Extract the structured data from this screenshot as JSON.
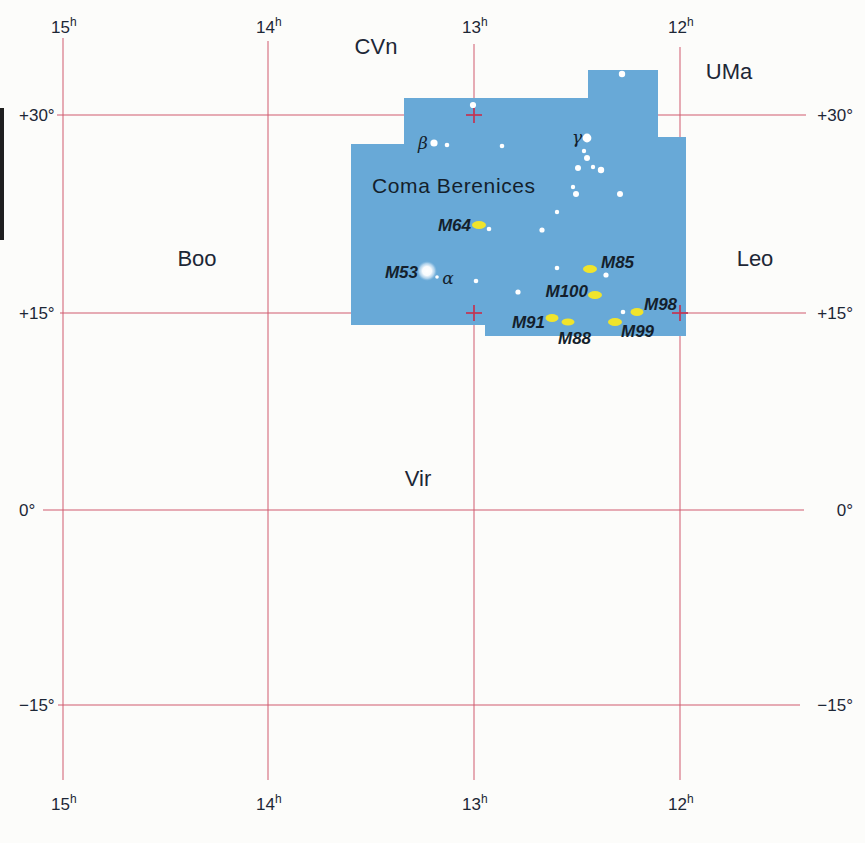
{
  "figure": {
    "width": 865,
    "height": 843,
    "background": "#fcfcfa",
    "colors": {
      "region_fill": "#68a9d7",
      "grid_line": "#d05a6e",
      "tick_cross": "#c23352",
      "text_dark": "#1d2736",
      "star_fill": "#ffffff",
      "messier_fill": "#f0e42c",
      "page_edge": "#1f1f1f"
    },
    "page_edge_bar": {
      "x": 0,
      "y": 108,
      "w": 4,
      "h": 132
    },
    "grid": {
      "top_label_baseline": 33,
      "bottom_label_baseline": 810,
      "left_label_x": 19,
      "right_label_x": 853,
      "vlines": [
        {
          "label": "15",
          "sup": "h",
          "x": 63,
          "y1": 38,
          "y2": 780
        },
        {
          "label": "14",
          "sup": "h",
          "x": 268,
          "y1": 41,
          "y2": 780
        },
        {
          "label": "13",
          "sup": "h",
          "x": 474,
          "y1": 44,
          "y2": 780
        },
        {
          "label": "12",
          "sup": "h",
          "x": 680,
          "y1": 47,
          "y2": 780
        }
      ],
      "hlines": [
        {
          "label": "+30°",
          "y": 115,
          "x1": 57,
          "x2": 806
        },
        {
          "label": "+15°",
          "y": 313,
          "x1": 60,
          "x2": 806
        },
        {
          "label": "0°",
          "y": 510,
          "x1": 43,
          "x2": 804
        },
        {
          "label": "−15°",
          "y": 705,
          "x1": 58,
          "x2": 800
        }
      ],
      "crosses": [
        {
          "x": 474,
          "y": 115
        },
        {
          "x": 474,
          "y": 313
        },
        {
          "x": 680,
          "y": 313
        }
      ]
    },
    "region": {
      "label": "Coma Berenices",
      "label_x": 372,
      "label_y": 193,
      "polygon": "351,144 404,144 404,98 588,98 588,70 658,70 658,137 686,137 686,336 485,336 485,325 351,325"
    },
    "neighbor_labels": [
      {
        "name": "CVn",
        "x": 376,
        "y": 54
      },
      {
        "name": "UMa",
        "x": 729,
        "y": 79
      },
      {
        "name": "Boo",
        "x": 197,
        "y": 266
      },
      {
        "name": "Leo",
        "x": 755,
        "y": 266
      },
      {
        "name": "Vir",
        "x": 418,
        "y": 486
      }
    ],
    "star_labels": [
      {
        "name": "beta",
        "text": "β",
        "x": 423,
        "y": 149
      },
      {
        "name": "gamma",
        "text": "γ",
        "x": 577,
        "y": 143
      },
      {
        "name": "alpha",
        "text": "α",
        "x": 448,
        "y": 284
      }
    ],
    "stars": [
      {
        "x": 434,
        "y": 143,
        "r": 3.6
      },
      {
        "x": 447,
        "y": 145,
        "r": 2.3
      },
      {
        "x": 502,
        "y": 146,
        "r": 2.3
      },
      {
        "x": 473,
        "y": 105,
        "r": 3.1
      },
      {
        "x": 622,
        "y": 74,
        "r": 3.2
      },
      {
        "x": 587,
        "y": 138,
        "r": 4.4
      },
      {
        "x": 584,
        "y": 151,
        "r": 2.2
      },
      {
        "x": 587,
        "y": 158,
        "r": 3.0
      },
      {
        "x": 578,
        "y": 168,
        "r": 3.0
      },
      {
        "x": 593,
        "y": 167,
        "r": 2.2
      },
      {
        "x": 601,
        "y": 170,
        "r": 3.2
      },
      {
        "x": 573,
        "y": 187,
        "r": 2.2
      },
      {
        "x": 576,
        "y": 194,
        "r": 3.0
      },
      {
        "x": 620,
        "y": 194,
        "r": 3.0
      },
      {
        "x": 557,
        "y": 212,
        "r": 2.2
      },
      {
        "x": 489,
        "y": 229,
        "r": 2.3
      },
      {
        "x": 542,
        "y": 230,
        "r": 2.6
      },
      {
        "x": 437,
        "y": 277,
        "r": 1.8
      },
      {
        "x": 476,
        "y": 281,
        "r": 2.3
      },
      {
        "x": 557,
        "y": 268,
        "r": 2.3
      },
      {
        "x": 606,
        "y": 275,
        "r": 2.6
      },
      {
        "x": 518,
        "y": 292,
        "r": 2.6
      },
      {
        "x": 623,
        "y": 312,
        "r": 2.3
      }
    ],
    "deep_sky": [
      {
        "name": "M53",
        "type": "globular-cluster",
        "x": 427,
        "y": 271,
        "rx": 7,
        "ry": 7,
        "label_x": 418,
        "label_y": 278,
        "anchor": "end"
      },
      {
        "name": "M64",
        "type": "galaxy",
        "x": 479,
        "y": 225,
        "rx": 7,
        "ry": 4,
        "label_x": 471,
        "label_y": 231,
        "anchor": "end"
      },
      {
        "name": "M85",
        "type": "galaxy",
        "x": 590,
        "y": 269,
        "rx": 7,
        "ry": 4,
        "label_x": 601,
        "label_y": 268,
        "anchor": "start"
      },
      {
        "name": "M100",
        "type": "galaxy",
        "x": 595,
        "y": 295,
        "rx": 7,
        "ry": 4,
        "label_x": 588,
        "label_y": 297,
        "anchor": "end"
      },
      {
        "name": "M98",
        "type": "galaxy",
        "x": 637,
        "y": 312,
        "rx": 6.5,
        "ry": 4,
        "label_x": 644,
        "label_y": 310,
        "anchor": "start"
      },
      {
        "name": "M91",
        "type": "galaxy",
        "x": 552,
        "y": 318,
        "rx": 6.5,
        "ry": 4,
        "label_x": 545,
        "label_y": 328,
        "anchor": "end"
      },
      {
        "name": "M88",
        "type": "galaxy",
        "x": 568,
        "y": 322,
        "rx": 6.5,
        "ry": 3.5,
        "label_x": 558,
        "label_y": 344,
        "anchor": "start"
      },
      {
        "name": "M99",
        "type": "galaxy",
        "x": 615,
        "y": 322,
        "rx": 7,
        "ry": 4,
        "label_x": 621,
        "label_y": 337,
        "anchor": "start"
      }
    ]
  }
}
